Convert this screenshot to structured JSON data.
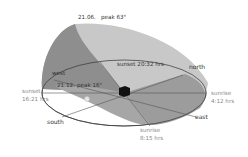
{
  "diagram": {
    "title_summer": {
      "date": "21.06.",
      "peak": "peak 63°"
    },
    "title_winter": {
      "date": "21.12.",
      "peak": "peak 16°"
    },
    "directions": {
      "north": "north",
      "east": "east",
      "south": "south",
      "west": "west"
    },
    "events": {
      "summer_sunrise": {
        "label": "sunrise",
        "time": "4:12 hrs"
      },
      "summer_sunset": {
        "label": "sunset 20:32 hrs"
      },
      "winter_sunrise": {
        "label": "sunrise",
        "time": "8:15 hrs"
      },
      "winter_sunset": {
        "label": "sunset",
        "time": "16:21 hrs"
      }
    },
    "colors": {
      "summer_arc_light": "#c8c8c8",
      "summer_arc_dark": "#8c8c8c",
      "winter_arc": "#a6a6a6",
      "horizon": "#ffffff",
      "house": "#111111",
      "lines": "#444444"
    }
  }
}
